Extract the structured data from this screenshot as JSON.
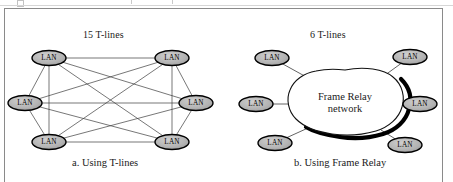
{
  "figure": {
    "frame_color": "#8a8a8a",
    "background": "#ffffff"
  },
  "node": {
    "label": "LAN",
    "fill": "#b3b3b3",
    "stroke": "#000000",
    "rx": 17,
    "ry": 7.5
  },
  "link": {
    "color": "#3c3c3c",
    "width": 0.7
  },
  "panel_a": {
    "heading": "15 T-lines",
    "caption": "a. Using T-lines",
    "topology": "full-mesh",
    "link_count": 15,
    "node_count": 6,
    "nodes": [
      {
        "id": "a1",
        "label": "LAN",
        "x": 49,
        "y": 58
      },
      {
        "id": "a2",
        "label": "LAN",
        "x": 172,
        "y": 58
      },
      {
        "id": "a3",
        "label": "LAN",
        "x": 25,
        "y": 103
      },
      {
        "id": "a4",
        "label": "LAN",
        "x": 196,
        "y": 103
      },
      {
        "id": "a5",
        "label": "LAN",
        "x": 49,
        "y": 142
      },
      {
        "id": "a6",
        "label": "LAN",
        "x": 172,
        "y": 142
      }
    ],
    "edges": [
      [
        "a1",
        "a2"
      ],
      [
        "a1",
        "a3"
      ],
      [
        "a1",
        "a4"
      ],
      [
        "a1",
        "a5"
      ],
      [
        "a1",
        "a6"
      ],
      [
        "a2",
        "a3"
      ],
      [
        "a2",
        "a4"
      ],
      [
        "a2",
        "a5"
      ],
      [
        "a2",
        "a6"
      ],
      [
        "a3",
        "a4"
      ],
      [
        "a3",
        "a5"
      ],
      [
        "a3",
        "a6"
      ],
      [
        "a4",
        "a5"
      ],
      [
        "a4",
        "a6"
      ],
      [
        "a5",
        "a6"
      ]
    ]
  },
  "panel_b": {
    "heading": "6 T-lines",
    "caption": "b. Using Frame Relay",
    "topology": "hub-cloud",
    "link_count": 6,
    "node_count": 6,
    "cloud": {
      "label_line1": "Frame Relay",
      "label_line2": "network",
      "fill": "#ffffff",
      "stroke": "#000000",
      "shadow": "#000000",
      "center_x": 345,
      "center_y": 104
    },
    "nodes": [
      {
        "id": "b1",
        "label": "LAN",
        "x": 272,
        "y": 58,
        "attach_x": 310,
        "attach_y": 79
      },
      {
        "id": "b2",
        "label": "LAN",
        "x": 410,
        "y": 57,
        "attach_x": 381,
        "attach_y": 78
      },
      {
        "id": "b3",
        "label": "LAN",
        "x": 256,
        "y": 104,
        "attach_x": 289,
        "attach_y": 104
      },
      {
        "id": "b4",
        "label": "LAN",
        "x": 420,
        "y": 104,
        "attach_x": 400,
        "attach_y": 104
      },
      {
        "id": "b5",
        "label": "LAN",
        "x": 275,
        "y": 143,
        "attach_x": 308,
        "attach_y": 128
      },
      {
        "id": "b6",
        "label": "LAN",
        "x": 405,
        "y": 145,
        "attach_x": 381,
        "attach_y": 130
      }
    ]
  }
}
